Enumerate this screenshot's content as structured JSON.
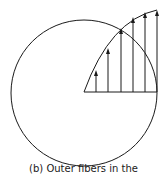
{
  "caption": "(b) Outer fibers in the",
  "diagram": {
    "circle": {
      "cx": 84,
      "cy": 93,
      "r": 73
    },
    "baseline": {
      "x1": 84,
      "x2": 157,
      "y": 92
    },
    "arrows": [
      {
        "x": 96,
        "top": 70
      },
      {
        "x": 108,
        "top": 48
      },
      {
        "x": 121,
        "top": 28
      },
      {
        "x": 133,
        "top": 17
      },
      {
        "x": 145,
        "top": 12
      },
      {
        "x": 157,
        "top": 10
      }
    ],
    "stroke_color": "#1a1a1a"
  }
}
